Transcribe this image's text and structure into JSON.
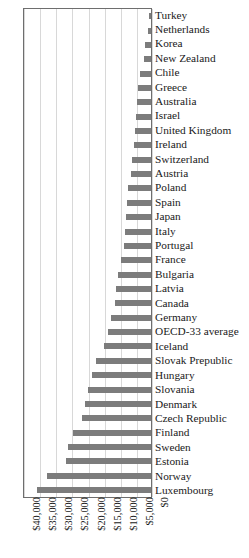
{
  "caption": {
    "text": "OECD average. The US is not shown as it offers no statutory maternity pay."
  },
  "chart_data": {
    "type": "bar",
    "orientation": "horizontal",
    "title": "",
    "xlabel": "",
    "ylabel": "",
    "xlim": [
      40000,
      0
    ],
    "x_reversed": true,
    "grid": true,
    "legend": "none",
    "xticks": [
      "$40,000",
      "$35,000",
      "$30,000",
      "$25,000",
      "$20,000",
      "$15,000",
      "$10,000",
      "$5,000",
      "$0"
    ],
    "xtick_values": [
      40000,
      35000,
      30000,
      25000,
      20000,
      15000,
      10000,
      5000,
      0
    ],
    "bar_color": "#7c7c7c",
    "categories": [
      "Turkey",
      "Netherlands",
      "Korea",
      "New Zealand",
      "Chile",
      "Greece",
      "Australia",
      "Israel",
      "United Kingdom",
      "Ireland",
      "Switzerland",
      "Austria",
      "Poland",
      "Spain",
      "Japan",
      "Italy",
      "Portugal",
      "France",
      "Bulgaria",
      "Latvia",
      "Canada",
      "Germany",
      "OECD-33 average",
      "Iceland",
      "Slovak Prepublic",
      "Hungary",
      "Slovania",
      "Denmark",
      "Czech Republic",
      "Finland",
      "Sweden",
      "Estonia",
      "Norway",
      "Luxembourg"
    ],
    "values": [
      600,
      900,
      2000,
      2300,
      3500,
      3900,
      4300,
      4600,
      5000,
      5400,
      5800,
      6200,
      7000,
      7400,
      7700,
      8100,
      8500,
      9300,
      10100,
      10900,
      11300,
      12400,
      13200,
      14600,
      17000,
      18200,
      19400,
      20500,
      21300,
      24100,
      25700,
      26500,
      32400,
      35400
    ]
  }
}
